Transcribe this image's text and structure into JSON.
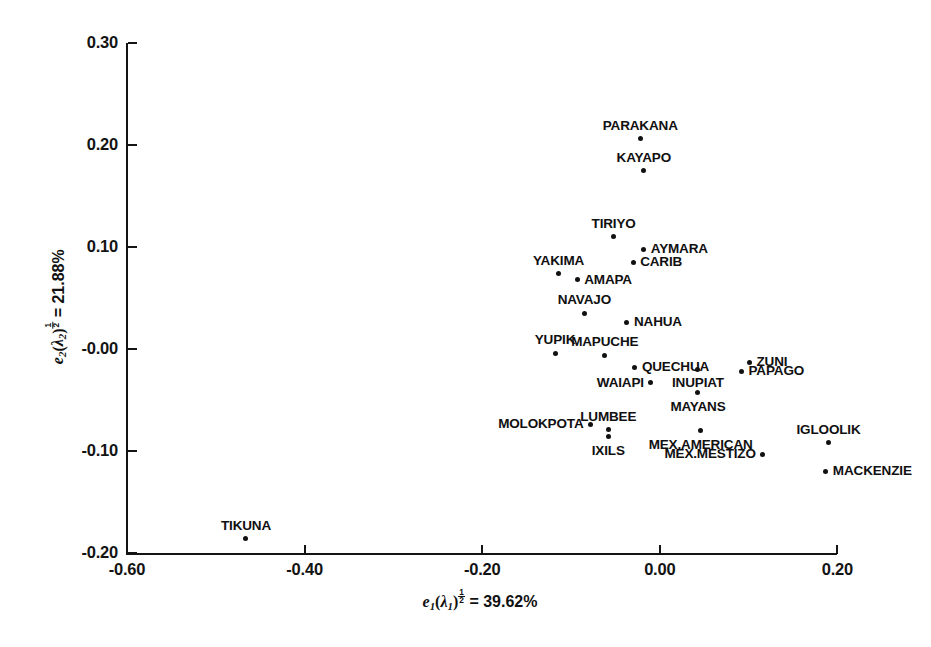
{
  "figure": {
    "background": "#ffffff",
    "ink_color": "#111111"
  },
  "axes": {
    "x": {
      "title_plain": "e1(lambda1)^(1/2) = 39.62%",
      "variable": "e",
      "variable_sub": "1",
      "lambda": "λ",
      "lambda_sub": "1",
      "exponent_num": "1",
      "exponent_den": "2",
      "equals_value": "= 39.62%",
      "ticks": [
        "-0.60",
        "-0.40",
        "-0.20",
        "0.00",
        "0.20"
      ],
      "tick_values": [
        -0.6,
        -0.4,
        -0.2,
        0.0,
        0.2
      ],
      "range": [
        -0.6,
        0.2
      ]
    },
    "y": {
      "title_plain": "e2(lambda2)^(1/2) = 21.88%",
      "variable": "e",
      "variable_sub": "2",
      "lambda": "λ",
      "lambda_sub": "2",
      "exponent_num": "1",
      "exponent_den": "2",
      "equals_value": "= 21.88%",
      "ticks": [
        "0.30",
        "0.20",
        "0.10",
        "-0.00",
        "-0.10",
        "-0.20"
      ],
      "tick_values": [
        0.3,
        0.2,
        0.1,
        -0.0,
        -0.1,
        -0.2
      ],
      "range": [
        -0.2,
        0.3
      ]
    }
  },
  "chart_data": {
    "type": "scatter",
    "title": "",
    "xlabel": "e1(λ1)^½ = 39.62%",
    "ylabel": "e2(λ2)^½ = 21.88%",
    "xlim": [
      -0.6,
      0.2
    ],
    "ylim": [
      -0.2,
      0.3
    ],
    "grid": false,
    "legend": "none",
    "marker": "filled-circle",
    "point_label_font": "bold sans-serif uppercase",
    "points": [
      {
        "label": "PARAKANA",
        "x": -0.022,
        "y": 0.206,
        "label_pos": "above"
      },
      {
        "label": "KAYAPO",
        "x": -0.018,
        "y": 0.175,
        "label_pos": "above"
      },
      {
        "label": "TIRIYO",
        "x": -0.052,
        "y": 0.11,
        "label_pos": "above"
      },
      {
        "label": "AYMARA",
        "x": -0.018,
        "y": 0.098,
        "label_pos": "right"
      },
      {
        "label": "YAKIMA",
        "x": -0.114,
        "y": 0.074,
        "label_pos": "above"
      },
      {
        "label": "CARIB",
        "x": -0.03,
        "y": 0.085,
        "label_pos": "right"
      },
      {
        "label": "AMAPA",
        "x": -0.093,
        "y": 0.068,
        "label_pos": "right"
      },
      {
        "label": "NAVAJO",
        "x": -0.085,
        "y": 0.035,
        "label_pos": "above"
      },
      {
        "label": "NAHUA",
        "x": -0.037,
        "y": 0.026,
        "label_pos": "right"
      },
      {
        "label": "YUPIK",
        "x": -0.118,
        "y": -0.004,
        "label_pos": "above"
      },
      {
        "label": "MAPUCHE",
        "x": -0.062,
        "y": -0.006,
        "label_pos": "above"
      },
      {
        "label": "QUECHUA",
        "x": -0.028,
        "y": -0.018,
        "label_pos": "right"
      },
      {
        "label": "ZUNI",
        "x": 0.101,
        "y": -0.013,
        "label_pos": "right"
      },
      {
        "label": "PAPAGO",
        "x": 0.092,
        "y": -0.022,
        "label_pos": "right"
      },
      {
        "label": "INUPIAT",
        "x": 0.043,
        "y": -0.02,
        "label_pos": "below"
      },
      {
        "label": "WAIAPI",
        "x": -0.01,
        "y": -0.033,
        "label_pos": "left"
      },
      {
        "label": "MAYANS",
        "x": 0.043,
        "y": -0.043,
        "label_pos": "below"
      },
      {
        "label": "MOLOKPOTA",
        "x": -0.078,
        "y": -0.074,
        "label_pos": "left"
      },
      {
        "label": "LUMBEE",
        "x": -0.058,
        "y": -0.079,
        "label_pos": "above"
      },
      {
        "label": "IXILS",
        "x": -0.058,
        "y": -0.086,
        "label_pos": "below"
      },
      {
        "label": "MEX.AMERICAN",
        "x": 0.046,
        "y": -0.08,
        "label_pos": "below"
      },
      {
        "label": "IGLOOLIK",
        "x": 0.19,
        "y": -0.092,
        "label_pos": "above"
      },
      {
        "label": "MEX.MESTIZO",
        "x": 0.116,
        "y": -0.103,
        "label_pos": "left"
      },
      {
        "label": "MACKENZIE",
        "x": 0.187,
        "y": -0.12,
        "label_pos": "right"
      },
      {
        "label": "TIKUNA",
        "x": -0.466,
        "y": -0.186,
        "label_pos": "above"
      }
    ]
  }
}
